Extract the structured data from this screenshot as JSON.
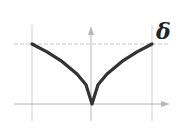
{
  "diagram": {
    "type": "function-sketch",
    "label": "δ",
    "colors": {
      "curve": "#333333",
      "grid": "#c8c8c8",
      "axis": "#b0b0b0",
      "label": "#222222"
    }
  },
  "chart_data": {
    "type": "line",
    "title": "",
    "xlabel": "",
    "ylabel": "",
    "annotations": [
      "δ"
    ],
    "x": [
      -1,
      -0.75,
      -0.5,
      -0.25,
      -0.1,
      0,
      0.1,
      0.25,
      0.5,
      0.75,
      1
    ],
    "series": [
      {
        "name": "curve",
        "values": [
          1,
          0.87,
          0.71,
          0.5,
          0.32,
          0,
          0.32,
          0.5,
          0.71,
          0.87,
          1
        ]
      }
    ],
    "xlim": [
      -1,
      1
    ],
    "ylim": [
      0,
      1
    ],
    "grid": true,
    "reference_lines": {
      "horizontal_dashed": 1,
      "vertical": [
        -1,
        1
      ]
    }
  }
}
